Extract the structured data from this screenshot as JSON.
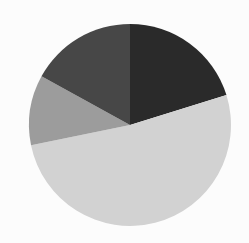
{
  "chart_data": {
    "type": "pie",
    "title": "",
    "labels": [
      "Slice A",
      "Slice B",
      "Slice C",
      "Slice D"
    ],
    "values": [
      20.2,
      51.6,
      11.2,
      17.0
    ],
    "colors": [
      "#2a2a2a",
      "#d2d2d2",
      "#9c9c9c",
      "#474747"
    ],
    "start_angle_deg": 0,
    "direction": "clockwise",
    "legend": false,
    "center": [
      130,
      125
    ],
    "radius": 101
  },
  "colors": {
    "background": "#fcfcfc"
  }
}
